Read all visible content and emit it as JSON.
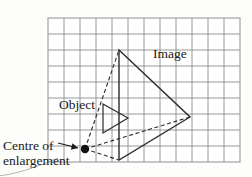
{
  "figure": {
    "type": "geometric-diagram",
    "background_color": "#fdfdfc"
  },
  "grid": {
    "columns": 12,
    "rows": 9,
    "cell_size_px": 16,
    "origin_px": {
      "x": 48,
      "y": 18
    },
    "line_color": "#8c8c8c",
    "border_color": "#9a9a9a",
    "visible": true
  },
  "labels": {
    "image": "Image",
    "object": "Object",
    "centre_line1": "Centre of",
    "centre_line2": "enlargement"
  },
  "shapes": {
    "object_triangle": {
      "name": "Object",
      "style": "solid",
      "stroke": "#2b2b2b",
      "stroke_width": 1.2,
      "vertices_px": [
        {
          "x": 103,
          "y": 104
        },
        {
          "x": 128,
          "y": 118
        },
        {
          "x": 103,
          "y": 133
        }
      ]
    },
    "image_triangle": {
      "name": "Image",
      "style": "solid",
      "stroke": "#2b2b2b",
      "stroke_width": 1.4,
      "vertices_px": [
        {
          "x": 119,
          "y": 50
        },
        {
          "x": 190,
          "y": 117
        },
        {
          "x": 119,
          "y": 160
        }
      ]
    },
    "centre_of_enlargement": {
      "name": "Centre of enlargement",
      "marker": "filled-circle",
      "color": "#111111",
      "position_px": {
        "x": 85,
        "y": 149
      },
      "radius_px": 4.2
    },
    "rays": {
      "style": "dashed",
      "stroke": "#2b2b2b",
      "stroke_width": 1.1,
      "dash_pattern": "4,2.6",
      "from_px": {
        "x": 85,
        "y": 149
      },
      "to_px": [
        {
          "x": 119,
          "y": 50
        },
        {
          "x": 190,
          "y": 117
        },
        {
          "x": 119,
          "y": 160
        }
      ]
    },
    "pointer_arrow": {
      "name": "Arrow pointing to centre of enlargement",
      "color": "#1a1a1a",
      "tail_px": {
        "x": 58,
        "y": 143
      },
      "head_px": {
        "x": 78,
        "y": 148
      }
    },
    "corner_swoosh": {
      "name": "Decorative page-curl stroke",
      "color": "#b4b4b4",
      "stroke_width": 1.0
    }
  }
}
